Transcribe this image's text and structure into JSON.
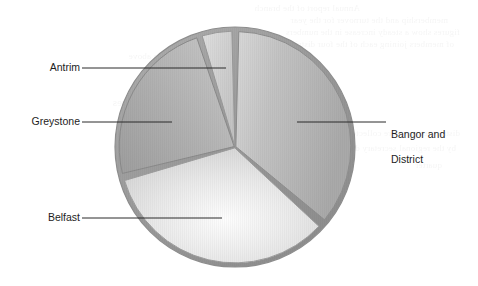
{
  "chart_data": {
    "type": "pie",
    "title": "",
    "subtitle": "",
    "xlabel": "",
    "ylabel": "",
    "legend_position": "none",
    "labels_position": "callout-leader-lines",
    "grid": false,
    "categories": [
      "Bangor and District",
      "Belfast",
      "Greystone",
      "Antrim"
    ],
    "values": [
      35.5,
      33.5,
      23.5,
      7.5
    ],
    "units": "percent",
    "slices": [
      {
        "name": "Bangor and District",
        "label": "Bangor and\nDistrict",
        "value": 35.5,
        "start_angle": 1.5,
        "end_angle": 129.5,
        "color": "#b9b9b9",
        "edge_color": "#8e8e8e",
        "explode": 0.9,
        "label_side": "right"
      },
      {
        "name": "Belfast",
        "label": "Belfast",
        "value": 33.5,
        "start_angle": 133.0,
        "end_angle": 253.5,
        "color": "#efefef",
        "edge_color": "#9d9d9d",
        "explode": 0.9,
        "label_side": "left"
      },
      {
        "name": "Greystone",
        "label": "Greystone",
        "value": 23.5,
        "start_angle": 256.5,
        "end_angle": 341.0,
        "color": "#b3b3b3",
        "edge_color": "#8a8a8a",
        "explode": 0.9,
        "label_side": "left"
      },
      {
        "name": "Antrim",
        "label": "Antrim",
        "value": 7.5,
        "start_angle": 343.5,
        "end_angle": 358.5,
        "color": "#cfcfcf",
        "edge_color": "#9a9a9a",
        "explode": 0.9,
        "label_side": "left"
      }
    ],
    "geometry": {
      "center_x": 235,
      "center_y": 147,
      "radius": 120,
      "rim_width": 5
    },
    "colors": {
      "background": "#ffffff",
      "leader_line": "#2b2b2b",
      "text": "#1d1d1d",
      "rim": "#9a9a9a"
    }
  },
  "labels": {
    "antrim": {
      "text": "Antrim",
      "leader": {
        "x1": 82,
        "y1": 68,
        "x2": 226,
        "y2": 68
      }
    },
    "greystone": {
      "text": "Greystone",
      "leader": {
        "x1": 82,
        "y1": 122,
        "x2": 172,
        "y2": 122
      }
    },
    "belfast": {
      "text": "Belfast",
      "leader": {
        "x1": 82,
        "y1": 218,
        "x2": 222,
        "y2": 218
      }
    },
    "bangor": {
      "line1": "Bangor and",
      "line2": "District",
      "text": "Bangor and District",
      "leader": {
        "x1": 297,
        "y1": 122,
        "x2": 386,
        "y2": 122
      }
    }
  },
  "background_bleed": {
    "note": "faint mirrored scan bleed-through",
    "lines": [
      {
        "x": 118,
        "y": 3,
        "size": 9,
        "text": "Annual report of the branch"
      },
      {
        "x": 30,
        "y": 15,
        "size": 9,
        "text": "membership and the turnover for the year"
      },
      {
        "x": 18,
        "y": 27,
        "size": 9,
        "text": "figures show a steady increase in the numbers"
      },
      {
        "x": 24,
        "y": 39,
        "size": 9,
        "text": "of members joining each of the four districts"
      },
      {
        "x": 300,
        "y": 51,
        "size": 9,
        "text": "shown above"
      },
      {
        "x": 296,
        "y": 96,
        "size": 11,
        "text": "District figures"
      },
      {
        "x": 18,
        "y": 128,
        "size": 9,
        "text": "district returns were collected and collated"
      },
      {
        "x": 22,
        "y": 143,
        "size": 9,
        "text": "by the regional secretary during the autumn"
      },
      {
        "x": 36,
        "y": 160,
        "size": 9,
        "text": "quarter"
      }
    ]
  }
}
